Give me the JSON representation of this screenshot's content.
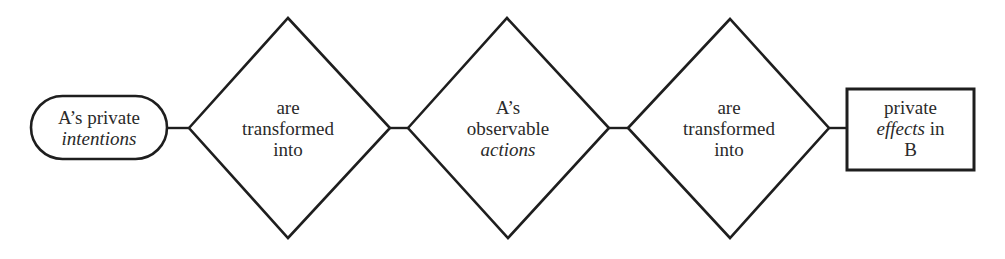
{
  "diagram": {
    "type": "flow",
    "direction": "left-to-right",
    "stroke_color": "#1e1e1e",
    "nodes": [
      {
        "id": "n1",
        "shape": "rounded-pill",
        "lines": [
          {
            "text": "A’s private",
            "italic": false
          },
          {
            "text": "intentions",
            "italic": true
          }
        ]
      },
      {
        "id": "n2",
        "shape": "diamond",
        "lines": [
          {
            "text": "are",
            "italic": false
          },
          {
            "text": "transformed",
            "italic": false
          },
          {
            "text": "into",
            "italic": false
          }
        ]
      },
      {
        "id": "n3",
        "shape": "diamond",
        "lines": [
          {
            "text": "A’s",
            "italic": false
          },
          {
            "text": "observable",
            "italic": false
          },
          {
            "text": "actions",
            "italic": true
          }
        ]
      },
      {
        "id": "n4",
        "shape": "diamond",
        "lines": [
          {
            "text": "are",
            "italic": false
          },
          {
            "text": "transformed",
            "italic": false
          },
          {
            "text": "into",
            "italic": false
          }
        ]
      },
      {
        "id": "n5",
        "shape": "rectangle",
        "lines": [
          {
            "text": "private",
            "italic": false
          },
          {
            "text_italic": "effects",
            "text_after": " in"
          },
          {
            "text": "B",
            "italic": false
          }
        ]
      }
    ],
    "edges": [
      {
        "from": "n1",
        "to": "n2"
      },
      {
        "from": "n2",
        "to": "n3"
      },
      {
        "from": "n3",
        "to": "n4"
      },
      {
        "from": "n4",
        "to": "n5"
      }
    ]
  }
}
